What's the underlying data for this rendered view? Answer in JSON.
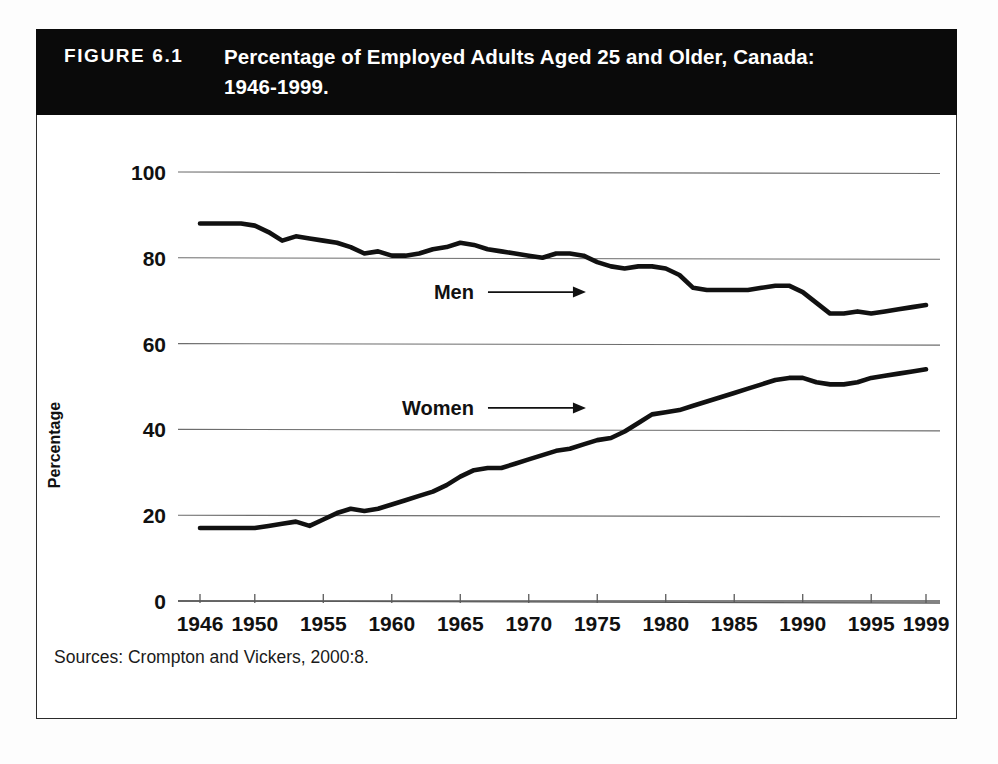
{
  "figure": {
    "number_label": "FIGURE 6.1",
    "title_line1": "Percentage of Employed Adults Aged 25 and Older, Canada:",
    "title_line2": "1946-1999.",
    "source_note": "Sources: Crompton and Vickers, 2000:8.",
    "banner_color": "#0a0a0a",
    "banner_text_color": "#ffffff",
    "frame_color": "#2b2b2b"
  },
  "chart_data": {
    "type": "line",
    "title": "Percentage of Employed Adults Aged 25 and Older, Canada: 1946-1999.",
    "xlabel": "",
    "ylabel": "Percentage",
    "xlim": [
      1946,
      1999
    ],
    "ylim": [
      0,
      100
    ],
    "yticks": [
      0,
      20,
      40,
      60,
      80,
      100
    ],
    "xticks": [
      1946,
      1950,
      1955,
      1960,
      1965,
      1970,
      1975,
      1980,
      1985,
      1990,
      1995,
      1999
    ],
    "grid": "horizontal",
    "legend_position": "inline-annotation",
    "line_color": "#111111",
    "annotations": [
      {
        "text": "Men",
        "x": 1966,
        "y": 72
      },
      {
        "text": "Women",
        "x": 1966,
        "y": 45
      }
    ],
    "series": [
      {
        "name": "Men",
        "x": [
          1946,
          1947,
          1948,
          1949,
          1950,
          1951,
          1952,
          1953,
          1954,
          1955,
          1956,
          1957,
          1958,
          1959,
          1960,
          1961,
          1962,
          1963,
          1964,
          1965,
          1966,
          1967,
          1968,
          1969,
          1970,
          1971,
          1972,
          1973,
          1974,
          1975,
          1976,
          1977,
          1978,
          1979,
          1980,
          1981,
          1982,
          1983,
          1984,
          1985,
          1986,
          1987,
          1988,
          1989,
          1990,
          1991,
          1992,
          1993,
          1994,
          1995,
          1996,
          1997,
          1998,
          1999
        ],
        "values": [
          88,
          88,
          88,
          88,
          87.5,
          86,
          84,
          85,
          84.5,
          84,
          83.5,
          82.5,
          81,
          81.5,
          80.5,
          80.5,
          81,
          82,
          82.5,
          83.5,
          83,
          82,
          81.5,
          81,
          80.5,
          80,
          81,
          81,
          80.5,
          79,
          78,
          77.5,
          78,
          78,
          77.5,
          76,
          73,
          72.5,
          72.5,
          72.5,
          72.5,
          73,
          73.5,
          73.5,
          72,
          69.5,
          67,
          67,
          67.5,
          67,
          67.5,
          68,
          68.5,
          69
        ]
      },
      {
        "name": "Women",
        "x": [
          1946,
          1947,
          1948,
          1949,
          1950,
          1951,
          1952,
          1953,
          1954,
          1955,
          1956,
          1957,
          1958,
          1959,
          1960,
          1961,
          1962,
          1963,
          1964,
          1965,
          1966,
          1967,
          1968,
          1969,
          1970,
          1971,
          1972,
          1973,
          1974,
          1975,
          1976,
          1977,
          1978,
          1979,
          1980,
          1981,
          1982,
          1983,
          1984,
          1985,
          1986,
          1987,
          1988,
          1989,
          1990,
          1991,
          1992,
          1993,
          1994,
          1995,
          1996,
          1997,
          1998,
          1999
        ],
        "values": [
          17,
          17,
          17,
          17,
          17,
          17.5,
          18,
          18.5,
          17.5,
          19,
          20.5,
          21.5,
          21,
          21.5,
          22.5,
          23.5,
          24.5,
          25.5,
          27,
          29,
          30.5,
          31,
          31,
          32,
          33,
          34,
          35,
          35.5,
          36.5,
          37.5,
          38,
          39.5,
          41.5,
          43.5,
          44,
          44.5,
          45.5,
          46.5,
          47.5,
          48.5,
          49.5,
          50.5,
          51.5,
          52,
          52,
          51,
          50.5,
          50.5,
          51,
          52,
          52.5,
          53,
          53.5,
          54
        ]
      }
    ]
  }
}
